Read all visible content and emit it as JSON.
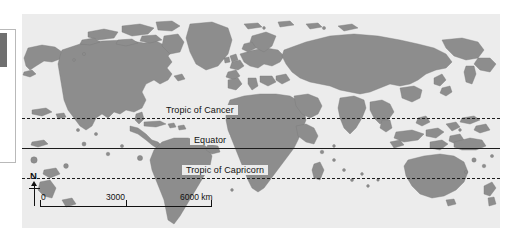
{
  "map": {
    "title": "World map",
    "ocean_color": "#ececec",
    "land_color": "#8d8d8d",
    "land_outline_color": "#6f6f6f",
    "line_color": "#1c1c1c",
    "projection": "equirectangular",
    "latitude_lines": [
      {
        "name": "tropic-of-cancer",
        "label": "Tropic of Cancer",
        "style": "dashed",
        "latitude": 23.5,
        "y": 104,
        "label_x": 140
      },
      {
        "name": "equator",
        "label": "Equator",
        "style": "solid",
        "latitude": 0,
        "y": 134,
        "label_x": 168
      },
      {
        "name": "tropic-of-capricorn",
        "label": "Tropic of Capricorn",
        "style": "dashed",
        "latitude": -23.5,
        "y": 164,
        "label_x": 160
      }
    ],
    "scale_bar": {
      "name": "scale-bar",
      "labels": [
        "0",
        "3000",
        "6000 km"
      ],
      "values": [
        0,
        3000,
        6000
      ],
      "unit": "km"
    },
    "north_arrow": {
      "name": "north-arrow",
      "label": "N"
    }
  },
  "document_frame": {
    "name": "document-margin-frame",
    "tab_color": "#6f6f6f"
  }
}
